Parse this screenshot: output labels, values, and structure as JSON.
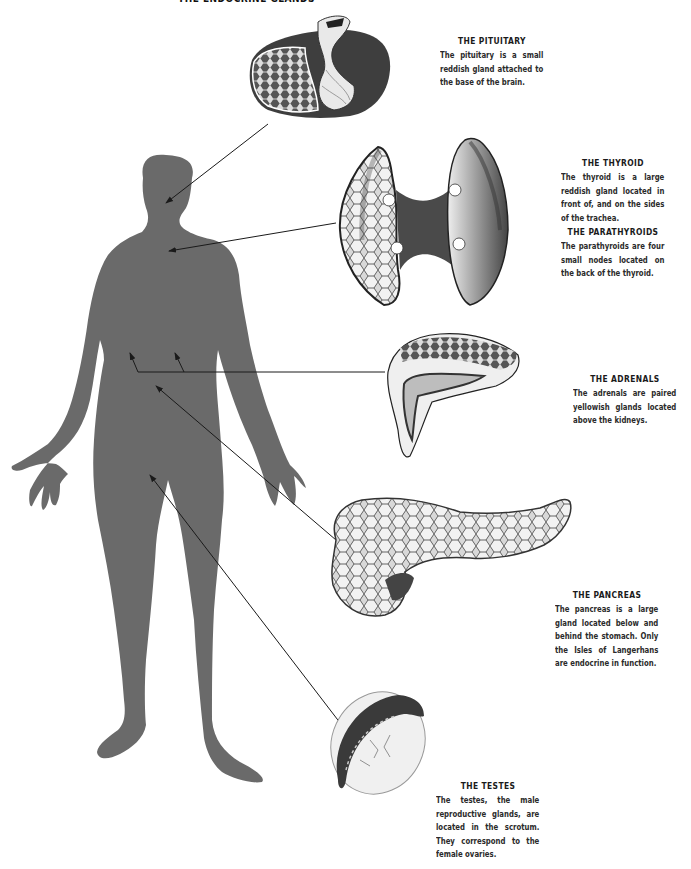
{
  "page": {
    "title": "THE ENDOCRINE GLANDS",
    "figure_color": "#6a6a6a",
    "line_color": "#1a1a1a"
  },
  "glands": [
    {
      "id": "pituitary",
      "heading": "THE PITUITARY",
      "text": "The pituitary is a small reddish gland attached to the base of the brain."
    },
    {
      "id": "thyroid",
      "heading": "THE THYROID",
      "text": "The thyroid is a large reddish gland located in front of, and on the sides of the trachea."
    },
    {
      "id": "parathyroids",
      "heading": "THE PARATHYROIDS",
      "text": "The parathyroids are four small nodes located on the back of the thyroid."
    },
    {
      "id": "adrenals",
      "heading": "THE ADRENALS",
      "text": "The adrenals are paired yellowish glands located above the kidneys."
    },
    {
      "id": "pancreas",
      "heading": "THE PANCREAS",
      "text": "The pancreas is a large gland located below and behind the stomach. Only the Isles of Langerhans are endocrine in function."
    },
    {
      "id": "testes",
      "heading": "THE TESTES",
      "text": "The testes, the male reproductive glands, are located in the scrotum. They correspond to the female ovaries."
    }
  ]
}
